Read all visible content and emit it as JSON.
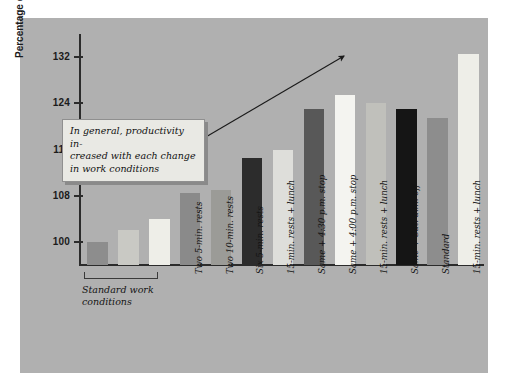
{
  "chart_data": {
    "type": "bar",
    "title": "",
    "xlabel": "",
    "ylabel": "Percentage of standard output",
    "ylim": [
      96,
      136
    ],
    "yticks": [
      100,
      108,
      116,
      124,
      132
    ],
    "ytick_labels": [
      "100",
      "108",
      "116",
      "124",
      "132"
    ],
    "grid": false,
    "legend": null,
    "categories": [
      "",
      "",
      "",
      "Two 5-min. rests",
      "Two 10-min. rests",
      "Six 5-min. rests",
      "15-min. rests + lunch",
      "Same + 4:30 p.m. stop",
      "Same + 4:00 p.m. stop",
      "15-min. rests + lunch",
      "Same + Sat. a.m. off",
      "Standard",
      "15-min. rests + lunch"
    ],
    "values": [
      100,
      102,
      104,
      108.5,
      109,
      114.5,
      116,
      123,
      125.5,
      124,
      123,
      121.5,
      132.5
    ],
    "bar_colors": [
      "#8d8d8d",
      "#c9c9c4",
      "#eeeee8",
      "#8a8a8a",
      "#9b9b97",
      "#2c2c2c",
      "#dededa",
      "#585858",
      "#f4f4f0",
      "#c0c0bb",
      "#151515",
      "#8d8d8d",
      "#eeeee8"
    ],
    "annotations": [
      {
        "name": "trend-note",
        "text": "In general, productivity in-\ncreased with each change\nin work conditions"
      },
      {
        "name": "trend-arrow",
        "text": ""
      },
      {
        "name": "baseline-group",
        "text": "Standard work\nconditions"
      }
    ],
    "colors": {
      "panel_background": "#b0b0b0",
      "page_background": "#ffffff",
      "axis": "#2b2b2b",
      "callout_fill": "#e9e9e4",
      "callout_border": "#8f8f8f",
      "text": "#141414"
    }
  },
  "axis": {
    "y_title": "Percentage of standard output"
  },
  "callout": {
    "text": "In general, productivity in-\ncreased with each change\nin work conditions"
  },
  "group": {
    "label": "Standard work\nconditions"
  },
  "bar_labels": {
    "b3": "Two 5-min. rests",
    "b4": "Two 10-min. rests",
    "b5": "Six 5-min. rests",
    "b6": "15-min. rests + lunch",
    "b7": "Same + 4:30 p.m. stop",
    "b8": "Same + 4:00 p.m. stop",
    "b9": "15-min. rests + lunch",
    "b10": "Same + Sat. a.m. off",
    "b11": "Standard",
    "b12": "15-min. rests + lunch"
  }
}
